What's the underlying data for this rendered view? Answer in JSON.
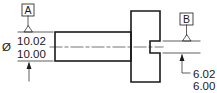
{
  "diagram": {
    "type": "engineering-drawing",
    "colors": {
      "line": "#1a1a1a",
      "background": "#ffffff"
    },
    "datums": [
      {
        "id": "A",
        "label": "A"
      },
      {
        "id": "B",
        "label": "B"
      }
    ],
    "dimensions": {
      "shaft_diameter": {
        "symbol": "Ø",
        "upper": "10.02",
        "lower": "10.00"
      },
      "slot_width": {
        "upper": "6.02",
        "lower": "6.00"
      }
    }
  }
}
